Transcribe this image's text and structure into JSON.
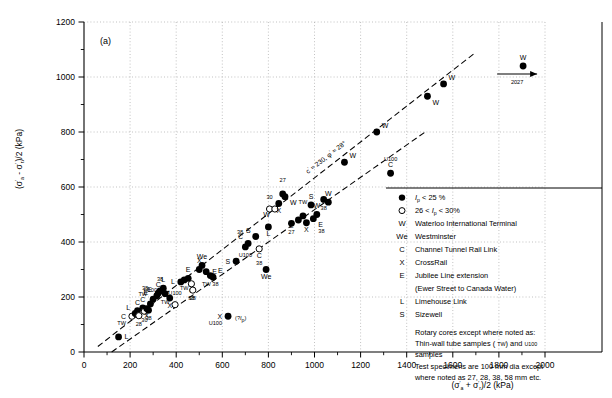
{
  "panel_label": "(a)",
  "axes": {
    "x_label_parts": [
      "(σ",
      "'",
      "a",
      " + σ",
      "'",
      "r",
      ")/2   (kPa)"
    ],
    "x_label": "(σ'a + σ'r)/2   (kPa)",
    "y_label": "(σ'a - σ'r)/2   (kPa)",
    "x_ticks": [
      0,
      200,
      400,
      600,
      800,
      1000,
      1200,
      1400,
      1600,
      1800,
      2000
    ],
    "y_ticks": [
      0,
      200,
      400,
      600,
      800,
      1000,
      1200
    ],
    "x_minor_step": 100,
    "y_minor_step": 100,
    "xlim": [
      0,
      2000
    ],
    "ylim": [
      0,
      1200
    ]
  },
  "annotations": {
    "envelope": "c' ≈ 230, φ' ≈ 28°",
    "truncated_value": "2027",
    "truncated_label": "W",
    "unknown_ip": "(?Ip)"
  },
  "legend": {
    "rows": [
      {
        "sym": "●",
        "symtype": "filled",
        "text": "Ip < 25 %"
      },
      {
        "sym": "○",
        "symtype": "open",
        "text": "26 < Ip < 30%"
      },
      {
        "sym": "W",
        "symtype": "letter",
        "text": "Waterloo International Terminal"
      },
      {
        "sym": "We",
        "symtype": "letter",
        "text": "Westminster"
      },
      {
        "sym": "C",
        "symtype": "letter",
        "text": "Channel Tunnel Rail Link"
      },
      {
        "sym": "X",
        "symtype": "letter",
        "text": "CrossRail"
      },
      {
        "sym": "E",
        "symtype": "letter",
        "text": "Jubilee Line extension"
      },
      {
        "sym": "",
        "symtype": "cont",
        "text": "(Ewer Street to Canada Water)"
      },
      {
        "sym": "L",
        "symtype": "letter",
        "text": "Limehouse Link"
      },
      {
        "sym": "S",
        "symtype": "letter",
        "text": "Sizewell"
      }
    ],
    "notes": [
      "Rotary cores except where noted as:",
      "Thin-wall tube samples ( TW) and U100",
      "samples",
      "Test specimens are 100 mm dia except",
      "where noted as 27, 28, 38, 58 mm etc."
    ]
  },
  "chart_data": {
    "type": "scatter",
    "title": "",
    "xlabel": "(σ'a + σ'r)/2   (kPa)",
    "ylabel": "(σ'a - σ'r)/2   (kPa)",
    "xlim": [
      0,
      2000
    ],
    "ylim": [
      0,
      1200
    ],
    "grid": true,
    "legend_position": "right",
    "trend_lines": [
      {
        "name": "upper envelope",
        "style": "dashed",
        "x": [
          60,
          1700
        ],
        "y": [
          20,
          1090
        ],
        "label": "c' ≈ 230, φ' ≈ 28°"
      },
      {
        "name": "lower envelope",
        "style": "dashed",
        "x": [
          120,
          1480
        ],
        "y": [
          0,
          800
        ],
        "label": ""
      }
    ],
    "points": [
      {
        "x": 150,
        "y": 55,
        "fill": "filled",
        "site": "L",
        "lpos": "r"
      },
      {
        "x": 208,
        "y": 130,
        "fill": "open",
        "site": "C",
        "sub": "TW",
        "lpos": "l"
      },
      {
        "x": 222,
        "y": 140,
        "fill": "filled",
        "site": "L",
        "lpos": "tl"
      },
      {
        "x": 232,
        "y": 150,
        "fill": "filled",
        "site": "C",
        "lpos": "t"
      },
      {
        "x": 238,
        "y": 132,
        "fill": "open",
        "site": "",
        "sub": "28",
        "lpos": "b"
      },
      {
        "x": 255,
        "y": 160,
        "fill": "filled",
        "site": "C",
        "sub": "TW",
        "lpos": "t"
      },
      {
        "x": 262,
        "y": 148,
        "fill": "open",
        "site": "",
        "sub": "30",
        "lpos": "br"
      },
      {
        "x": 272,
        "y": 158,
        "fill": "filled",
        "site": "X",
        "lpos": "b"
      },
      {
        "x": 280,
        "y": 152,
        "fill": "filled",
        "site": "",
        "sub": "38",
        "lpos": "b"
      },
      {
        "x": 288,
        "y": 175,
        "fill": "filled",
        "site": "",
        "sub": "U100",
        "lpos": "t"
      },
      {
        "x": 300,
        "y": 192,
        "fill": "filled",
        "site": "E",
        "sub": "38",
        "lpos": "tl"
      },
      {
        "x": 316,
        "y": 205,
        "fill": "filled",
        "site": "E",
        "lpos": "tl"
      },
      {
        "x": 322,
        "y": 214,
        "fill": "filled",
        "site": "C",
        "lpos": "t"
      },
      {
        "x": 330,
        "y": 222,
        "fill": "filled",
        "site": "",
        "sub": "38",
        "lpos": "tl"
      },
      {
        "x": 344,
        "y": 232,
        "fill": "filled",
        "site": "L",
        "lpos": "t"
      },
      {
        "x": 352,
        "y": 212,
        "fill": "filled",
        "site": "",
        "sub": "TW",
        "lpos": "br"
      },
      {
        "x": 372,
        "y": 196,
        "fill": "filled",
        "site": "X",
        "lpos": "b"
      },
      {
        "x": 395,
        "y": 172,
        "fill": "open",
        "site": "",
        "sub": "U100",
        "lpos": "tr"
      },
      {
        "x": 420,
        "y": 255,
        "fill": "filled",
        "site": "L",
        "lpos": "l"
      },
      {
        "x": 435,
        "y": 262,
        "fill": "filled",
        "site": "",
        "sub": "TW",
        "lpos": "b"
      },
      {
        "x": 452,
        "y": 268,
        "fill": "filled",
        "site": "E",
        "lpos": "t"
      },
      {
        "x": 466,
        "y": 248,
        "fill": "open",
        "site": "C",
        "sub": "38",
        "lpos": "b"
      },
      {
        "x": 472,
        "y": 225,
        "fill": "open",
        "site": "",
        "sub": "28",
        "lpos": "b"
      },
      {
        "x": 500,
        "y": 300,
        "fill": "filled",
        "site": "X",
        "lpos": "t"
      },
      {
        "x": 512,
        "y": 315,
        "fill": "filled",
        "site": "We",
        "lpos": "t"
      },
      {
        "x": 530,
        "y": 292,
        "fill": "filled",
        "site": "E",
        "lpos": "r"
      },
      {
        "x": 548,
        "y": 278,
        "fill": "filled",
        "site": "",
        "sub": "TW 38",
        "lpos": "br"
      },
      {
        "x": 560,
        "y": 272,
        "fill": "filled",
        "site": "E",
        "lpos": "tr"
      },
      {
        "x": 625,
        "y": 130,
        "fill": "filled",
        "site": "X",
        "sub": "U100",
        "lpos": "l",
        "note": "(?Ip)"
      },
      {
        "x": 660,
        "y": 330,
        "fill": "filled",
        "site": "S",
        "lpos": "l"
      },
      {
        "x": 700,
        "y": 382,
        "fill": "filled",
        "site": "",
        "sub": "U100",
        "lpos": "bl"
      },
      {
        "x": 712,
        "y": 395,
        "fill": "filled",
        "site": "C",
        "sub": "38",
        "lpos": "tl"
      },
      {
        "x": 745,
        "y": 420,
        "fill": "filled",
        "site": "S",
        "lpos": "tl"
      },
      {
        "x": 760,
        "y": 375,
        "fill": "open",
        "site": "C",
        "sub": "38",
        "lpos": "b"
      },
      {
        "x": 790,
        "y": 300,
        "fill": "filled",
        "site": "We",
        "lpos": "b"
      },
      {
        "x": 800,
        "y": 455,
        "fill": "filled",
        "site": "L",
        "lpos": "b"
      },
      {
        "x": 805,
        "y": 520,
        "fill": "open",
        "site": "",
        "sub": "30",
        "lpos": "tl"
      },
      {
        "x": 828,
        "y": 520,
        "fill": "open",
        "site": "W",
        "lpos": "bl"
      },
      {
        "x": 845,
        "y": 540,
        "fill": "filled",
        "site": "X",
        "lpos": "b"
      },
      {
        "x": 862,
        "y": 575,
        "fill": "filled",
        "site": "",
        "sub": "27",
        "lpos": "t"
      },
      {
        "x": 872,
        "y": 565,
        "fill": "filled",
        "site": "W",
        "lpos": "br"
      },
      {
        "x": 900,
        "y": 468,
        "fill": "filled",
        "site": "",
        "sub": "27",
        "lpos": "bl"
      },
      {
        "x": 930,
        "y": 480,
        "fill": "filled",
        "site": "L",
        "lpos": "bl"
      },
      {
        "x": 950,
        "y": 495,
        "fill": "filled",
        "site": "",
        "sub": "TW",
        "lpos": "t"
      },
      {
        "x": 965,
        "y": 470,
        "fill": "filled",
        "site": "X",
        "lpos": "b"
      },
      {
        "x": 985,
        "y": 535,
        "fill": "filled",
        "site": "S",
        "lpos": "t"
      },
      {
        "x": 995,
        "y": 485,
        "fill": "filled",
        "site": "E",
        "sub": "38",
        "lpos": "br"
      },
      {
        "x": 1010,
        "y": 500,
        "fill": "filled",
        "site": "W",
        "lpos": "t"
      },
      {
        "x": 1040,
        "y": 555,
        "fill": "filled",
        "site": "",
        "sub": "38",
        "lpos": "b"
      },
      {
        "x": 1060,
        "y": 545,
        "fill": "filled",
        "site": "W",
        "lpos": "t"
      },
      {
        "x": 1130,
        "y": 690,
        "fill": "filled",
        "site": "W",
        "lpos": "tr"
      },
      {
        "x": 1330,
        "y": 650,
        "fill": "filled",
        "site": "C",
        "sub": "U100",
        "lpos": "t"
      },
      {
        "x": 1270,
        "y": 800,
        "fill": "filled",
        "site": "W",
        "lpos": "tr"
      },
      {
        "x": 1490,
        "y": 930,
        "fill": "filled",
        "site": "W",
        "lpos": "br"
      },
      {
        "x": 1560,
        "y": 975,
        "fill": "filled",
        "site": "W",
        "lpos": "tr"
      },
      {
        "x": 1905,
        "y": 1040,
        "fill": "filled",
        "site": "W",
        "lpos": "t",
        "truncated": true,
        "value": "2027"
      }
    ]
  }
}
